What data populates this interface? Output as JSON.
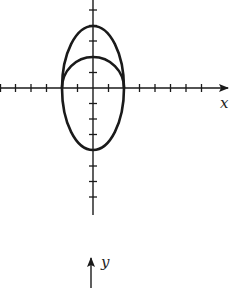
{
  "figure": {
    "x_axis_label": "x",
    "y_axis_label": "y",
    "colors": {
      "ink": "#1a1a1a",
      "background": "#ffffff"
    },
    "axes": {
      "origin_px": [
        93,
        88
      ],
      "unit_px": 15.5,
      "x_ticks_units": [
        -6,
        -5,
        -4,
        -3,
        -1,
        1,
        3,
        4,
        5,
        6,
        7
      ],
      "y_ticks_units": [
        5,
        4,
        3,
        1,
        -1,
        -2,
        -3,
        -5,
        -6,
        -7
      ]
    },
    "curves": [
      {
        "name": "circle-upper-half",
        "type": "semicircle",
        "center": [
          0,
          0
        ],
        "radius": 2
      },
      {
        "name": "ellipse",
        "type": "ellipse",
        "center": [
          0,
          0
        ],
        "semi_x": 2,
        "semi_y": 4
      }
    ],
    "second_axis": {
      "arrow_direction": "up",
      "label": "y"
    }
  }
}
